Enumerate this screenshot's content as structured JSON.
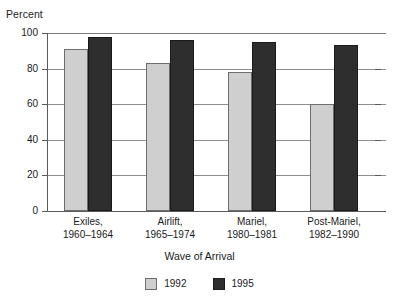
{
  "chart_data": {
    "type": "bar",
    "title": "",
    "subtitle": "",
    "xlabel": "Wave of Arrival",
    "ylabel": "Percent",
    "ylim": [
      0,
      100
    ],
    "yticks": [
      0,
      20,
      40,
      60,
      80,
      100
    ],
    "ytick_labels": [
      "0",
      "20",
      "40",
      "60",
      "80",
      "100"
    ],
    "grid": "horizontal",
    "legend_position": "bottom",
    "categories": [
      "Exiles,\n1960–1964",
      "Airlift,\n1965–1974",
      "Mariel,\n1980–1981",
      "Post-Mariel,\n1982–1990"
    ],
    "category_lines": [
      {
        "line1": "Exiles,",
        "line2": "1960–1964"
      },
      {
        "line1": "Airlift,",
        "line2": "1965–1974"
      },
      {
        "line1": "Mariel,",
        "line2": "1980–1981"
      },
      {
        "line1": "Post-Mariel,",
        "line2": "1982–1990"
      }
    ],
    "series": [
      {
        "name": "1992",
        "color": "#cfcfcf",
        "values": [
          91,
          83,
          78,
          60
        ]
      },
      {
        "name": "1995",
        "color": "#2e2e2e",
        "values": [
          98,
          96,
          95,
          93
        ]
      }
    ]
  },
  "legend": {
    "items": [
      {
        "label": "1992",
        "color": "#cfcfcf"
      },
      {
        "label": "1995",
        "color": "#2e2e2e"
      }
    ]
  },
  "axes": {
    "y_title": "Percent",
    "x_title": "Wave of Arrival"
  }
}
